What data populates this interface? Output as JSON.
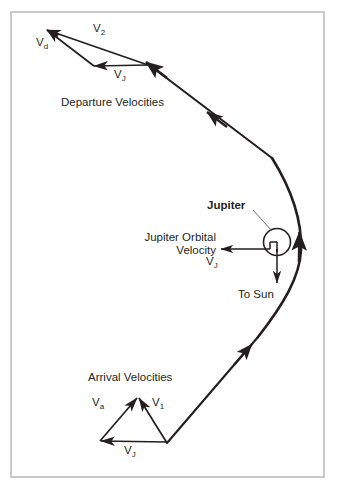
{
  "figure": {
    "background_color": "#ffffff",
    "border_color": "#c9c9c9",
    "ink_color": "#231f20"
  },
  "departure": {
    "caption": "Departure Velocities",
    "vectors": {
      "v2_label": "V",
      "v2_sub": "2",
      "vd_label": "V",
      "vd_sub": "d",
      "vj_label": "V",
      "vj_sub": "J"
    }
  },
  "arrival": {
    "caption": "Arrival Velocities",
    "vectors": {
      "va_label": "V",
      "va_sub": "a",
      "v1_label": "V",
      "v1_sub": "1",
      "vj_label": "V",
      "vj_sub": "J"
    }
  },
  "planet": {
    "name": "Jupiter",
    "orbital_velocity_line1": "Jupiter Orbital",
    "orbital_velocity_line2": "Velocity",
    "orbital_velocity_symbol": "V",
    "orbital_velocity_sub": "J",
    "sun_direction": "To Sun"
  }
}
